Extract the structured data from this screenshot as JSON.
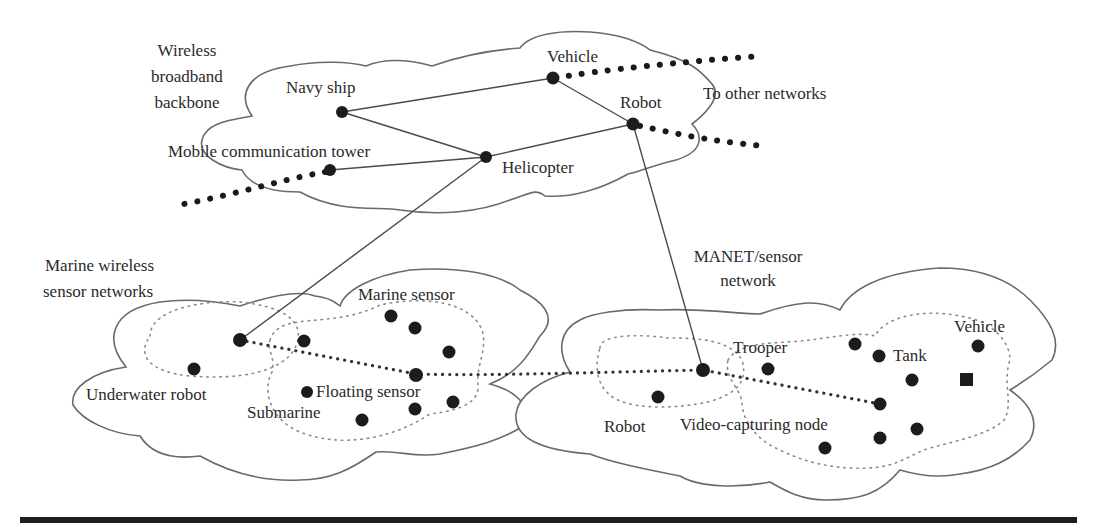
{
  "diagram": {
    "groups": {
      "backbone": {
        "label_lines": [
          "Wireless",
          "broadband",
          "backbone"
        ]
      },
      "marine": {
        "label_lines": [
          "Marine wireless",
          "sensor networks"
        ]
      },
      "manet": {
        "label_lines": [
          "MANET/sensor",
          "network"
        ]
      }
    },
    "labels": {
      "navy_ship": "Navy ship",
      "vehicle_top": "Vehicle",
      "robot_top": "Robot",
      "to_other_networks": "To other networks",
      "mobile_tower": "Mobile communication tower",
      "helicopter": "Helicopter",
      "marine_sensor": "Marine sensor",
      "underwater_robot": "Underwater robot",
      "floating_sensor": "Floating sensor",
      "submarine": "Submarine",
      "trooper": "Trooper",
      "tank": "Tank",
      "vehicle_bottom": "Vehicle",
      "robot_bottom": "Robot",
      "video_node": "Video-capturing node"
    },
    "edges": [
      [
        "Navy ship",
        "Vehicle"
      ],
      [
        "Navy ship",
        "Helicopter"
      ],
      [
        "Mobile communication tower",
        "Helicopter"
      ],
      [
        "Helicopter",
        "Robot"
      ],
      [
        "Vehicle",
        "Robot"
      ],
      [
        "Helicopter",
        "Underwater robot gateway"
      ],
      [
        "Robot",
        "MANET gateway"
      ]
    ],
    "colors": {
      "node": "#1c1c1c",
      "cloud_stroke": "#6a6a6a",
      "rule": "#1e1e1e"
    }
  }
}
